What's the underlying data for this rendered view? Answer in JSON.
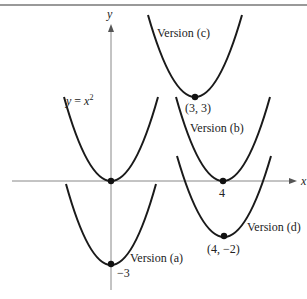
{
  "figure": {
    "axes": {
      "x_label": "x",
      "y_label": "y"
    },
    "curves": [
      {
        "id": "base",
        "label": "y = x",
        "exponent": "2",
        "vertex": [
          0,
          0
        ]
      },
      {
        "id": "a",
        "label": "Version (a)",
        "vertex": [
          0,
          -3
        ],
        "vertex_label": "−3"
      },
      {
        "id": "b",
        "label": "Version (b)",
        "vertex": [
          4,
          0
        ],
        "vertex_label": "4"
      },
      {
        "id": "c",
        "label": "Version (c)",
        "vertex": [
          3,
          3
        ],
        "vertex_label": "(3, 3)"
      },
      {
        "id": "d",
        "label": "Version (d)",
        "vertex": [
          4,
          -2
        ],
        "vertex_label": "(4, −2)"
      }
    ],
    "colors": {
      "curve": "#1a1a1a",
      "axis": "#888888",
      "rule": "#777777"
    }
  }
}
